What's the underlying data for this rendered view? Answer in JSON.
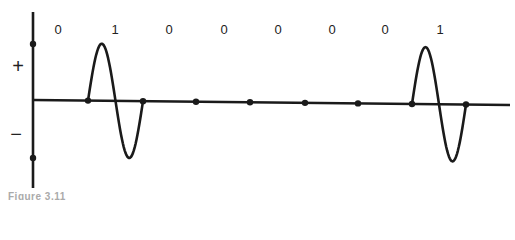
{
  "diagram": {
    "axis_color": "#1a1a1a",
    "signal_color": "#1a1a1a",
    "vertical_axis": {
      "x": 33,
      "y_top": 12,
      "y_bottom": 188,
      "dots_y": [
        44,
        158
      ]
    },
    "horizontal_axis": {
      "y_left": 100,
      "y_right": 105,
      "x_start": 33,
      "x_end": 510
    },
    "sign_labels": {
      "plus": "+",
      "minus": "−"
    },
    "bits": [
      {
        "value": "0",
        "x": 58
      },
      {
        "value": "1",
        "x": 115
      },
      {
        "value": "0",
        "x": 169
      },
      {
        "value": "0",
        "x": 224
      },
      {
        "value": "0",
        "x": 278
      },
      {
        "value": "0",
        "x": 332
      },
      {
        "value": "0",
        "x": 385
      },
      {
        "value": "1",
        "x": 440
      }
    ],
    "boundary_dots_x": [
      88,
      143,
      196,
      250,
      305,
      358,
      412,
      466
    ],
    "caption": "Figure 3.11"
  }
}
